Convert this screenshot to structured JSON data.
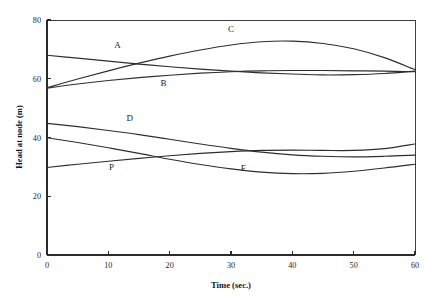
{
  "chart_data": {
    "type": "line",
    "title": "",
    "xlabel": "Time (sec.)",
    "ylabel": "Head at node (m)",
    "xlim": [
      0,
      60
    ],
    "ylim": [
      0,
      80
    ],
    "xticks": [
      0,
      10,
      20,
      30,
      40,
      50,
      60
    ],
    "yticks": [
      0,
      20,
      40,
      60,
      80
    ],
    "xtick_labels": [
      "0",
      "10",
      "20",
      "30",
      "40",
      "50",
      "60"
    ],
    "ytick_labels": [
      "0",
      "20",
      "40",
      "60",
      "80"
    ],
    "grid": false,
    "legend": "inline-labels",
    "line_color": "#2e2e2e",
    "x": [
      0,
      5,
      10,
      15,
      20,
      25,
      30,
      35,
      40,
      45,
      50,
      55,
      60
    ],
    "series": [
      {
        "name": "A",
        "label": "A",
        "label_x": 11.5,
        "label_y": 70.5,
        "values": [
          68.0,
          67.0,
          66.0,
          65.0,
          64.1,
          63.3,
          62.6,
          62.0,
          61.6,
          61.3,
          61.4,
          61.8,
          62.6
        ]
      },
      {
        "name": "B",
        "label": "B",
        "label_x": 19.0,
        "label_y": 57.5,
        "values": [
          56.8,
          58.2,
          59.4,
          60.4,
          61.2,
          61.9,
          62.4,
          62.7,
          62.8,
          62.8,
          62.7,
          62.6,
          62.4
        ]
      },
      {
        "name": "C",
        "label": "C",
        "label_x": 30.0,
        "label_y": 76.0,
        "values": [
          56.9,
          59.9,
          62.7,
          65.3,
          67.7,
          69.8,
          71.5,
          72.6,
          72.8,
          72.0,
          70.2,
          67.2,
          63.1
        ]
      },
      {
        "name": "D",
        "label": "D",
        "label_x": 13.5,
        "label_y": 45.5,
        "values": [
          44.8,
          43.7,
          42.4,
          41.0,
          39.4,
          37.8,
          36.3,
          35.0,
          34.1,
          33.6,
          33.4,
          33.6,
          34.0
        ]
      },
      {
        "name": "P",
        "label": "P",
        "label_x": 10.5,
        "label_y": 29.0,
        "values": [
          29.8,
          30.9,
          31.9,
          32.9,
          33.8,
          34.6,
          35.2,
          35.6,
          35.7,
          35.6,
          35.6,
          36.2,
          37.8
        ]
      },
      {
        "name": "F",
        "label": "F",
        "label_x": 32.0,
        "label_y": 28.7,
        "values": [
          39.9,
          38.3,
          36.5,
          34.6,
          32.6,
          30.8,
          29.3,
          28.2,
          27.7,
          27.8,
          28.5,
          29.6,
          30.9
        ]
      }
    ]
  },
  "axes": {
    "y_title": "Head at node (m)",
    "x_title": "Time (sec.)"
  }
}
